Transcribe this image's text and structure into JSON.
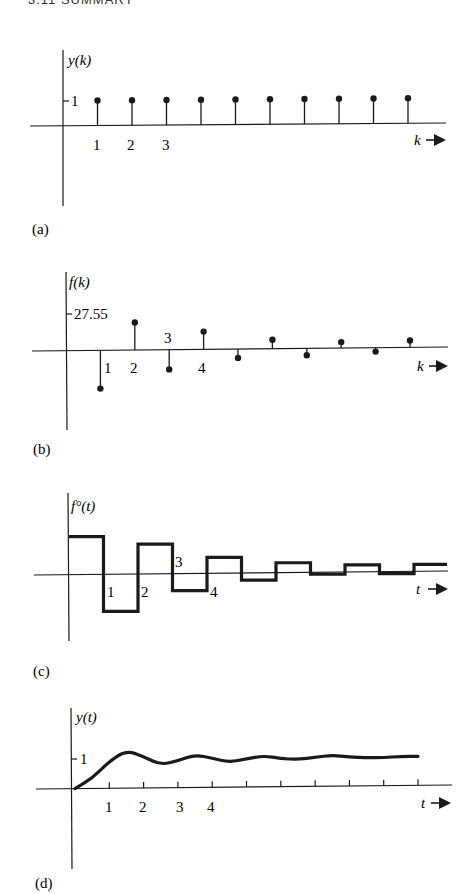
{
  "header": {
    "text": "3.11 SUMMARY"
  },
  "panels": [
    {
      "id": "a",
      "label": "(a)",
      "ylabel": "y(k)",
      "xlabel": "k",
      "ytick": "1",
      "xticks": [
        "1",
        "2",
        "3"
      ]
    },
    {
      "id": "b",
      "label": "(b)",
      "ylabel": "f(k)",
      "xlabel": "k",
      "ytick": "27.55",
      "xticks": [
        "1",
        "2",
        "3",
        "4"
      ]
    },
    {
      "id": "c",
      "label": "(c)",
      "ylabel": "f°(t)",
      "xlabel": "t",
      "ytick": "",
      "xticks": [
        "1",
        "2",
        "3",
        "4"
      ]
    },
    {
      "id": "d",
      "label": "(d)",
      "ylabel": "y(t)",
      "xlabel": "t",
      "ytick": "1",
      "xticks": [
        "1",
        "2",
        "3",
        "4"
      ]
    }
  ],
  "chart_data": [
    {
      "panel": "a",
      "type": "stem",
      "title": "",
      "xlabel": "k",
      "ylabel": "y(k)",
      "x": [
        1,
        2,
        3,
        4,
        5,
        6,
        7,
        8,
        9,
        10
      ],
      "values": [
        1,
        1,
        1,
        1,
        1,
        1,
        1,
        1,
        1,
        1
      ],
      "yticks": [
        1
      ],
      "xtick_labels": [
        "1",
        "2",
        "3"
      ],
      "grid": false
    },
    {
      "panel": "b",
      "type": "stem",
      "title": "",
      "xlabel": "k",
      "ylabel": "f(k)",
      "x": [
        0,
        1,
        2,
        3,
        4,
        5,
        6,
        7,
        8,
        9,
        10
      ],
      "values": [
        27.55,
        -28.5,
        20.5,
        -14.7,
        13.2,
        -6.6,
        6.6,
        -5.1,
        4.4,
        -2.9,
        5.1
      ],
      "yticks": [
        27.55
      ],
      "xtick_labels": [
        "1",
        "2",
        "3",
        "4"
      ],
      "grid": false
    },
    {
      "panel": "c",
      "type": "line",
      "subtype": "step (zero-order hold)",
      "title": "",
      "xlabel": "t",
      "ylabel": "f°(t)",
      "x": [
        0,
        1,
        2,
        3,
        4,
        5,
        6,
        7,
        8,
        9,
        10,
        11
      ],
      "values": [
        27.55,
        -26.8,
        21.7,
        -12.3,
        11.6,
        -5.1,
        7.2,
        -1.4,
        5.1,
        -1.4,
        5.1,
        5.1
      ],
      "xtick_labels": [
        "1",
        "2",
        "3",
        "4"
      ],
      "grid": false
    },
    {
      "panel": "d",
      "type": "line",
      "title": "",
      "xlabel": "t",
      "ylabel": "y(t)",
      "x": [
        0,
        0.5,
        1,
        1.5,
        2,
        2.5,
        3,
        3.5,
        4,
        4.5,
        5,
        5.5,
        6,
        6.5,
        7,
        7.5,
        8,
        8.5,
        9,
        9.5,
        10
      ],
      "values": [
        0,
        0.35,
        0.93,
        1.3,
        1.08,
        0.79,
        0.93,
        1.13,
        1.0,
        0.86,
        0.97,
        1.07,
        0.97,
        0.93,
        1.0,
        1.07,
        1.0,
        0.97,
        0.97,
        1.0,
        1.0
      ],
      "yticks": [
        1
      ],
      "xtick_labels": [
        "1",
        "2",
        "3",
        "4"
      ],
      "xticks_marked": [
        1,
        2,
        3,
        4,
        5,
        6,
        7,
        8,
        9,
        10
      ],
      "grid": false
    }
  ],
  "colors": {
    "ink": "#1a1a1a",
    "paper": "#ffffff"
  }
}
